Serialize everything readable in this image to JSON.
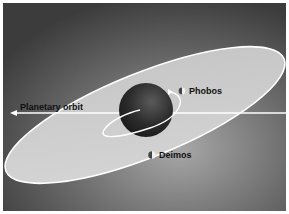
{
  "diagram": {
    "labels": {
      "planetary_orbit": "Planetary orbit",
      "phobos": "Phobos",
      "deimos": "Deimos"
    },
    "colors": {
      "background_dark": "#3a3a3a",
      "background_light": "#9a9a9a",
      "orbit_plane": "#cfcfcf",
      "orbit_line": "#ffffff",
      "planet": "#2a2a2a",
      "label_text": "#111111"
    }
  }
}
